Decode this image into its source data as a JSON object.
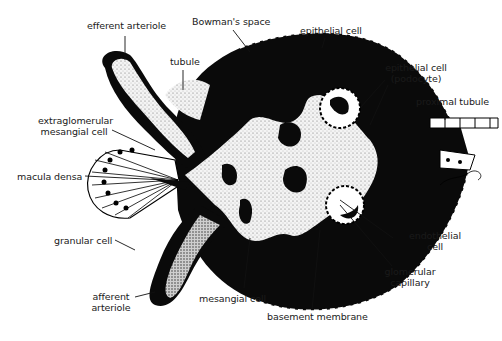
{
  "figure": {
    "colors": {
      "ink": "#0a0a0a",
      "paper": "#ffffff",
      "stipple": "#e8e8e8",
      "label_text": "#1a1a1a"
    },
    "labels": {
      "efferent_arteriole": "efferent arteriole",
      "bowmans_space": "Bowman's space",
      "epithelial_cell": "epithelial cell",
      "tubule": "tubule",
      "podocyte_line1": "epithelial cell",
      "podocyte_line2": "(podocyte)",
      "proximal_tubule": "proximal tubule",
      "extraglomerular_line1": "extraglomerular",
      "extraglomerular_line2": "mesangial cell",
      "macula_densa": "macula densa",
      "granular_cell": "granular cell",
      "afferent_line1": "afferent",
      "afferent_line2": "arteriole",
      "mesangial_cell": "mesangial cell",
      "basement_membrane": "basement membrane",
      "endothelial_line1": "endothelial",
      "endothelial_line2": "cell",
      "glomerular_line1": "glomerular",
      "glomerular_line2": "capillary"
    }
  }
}
